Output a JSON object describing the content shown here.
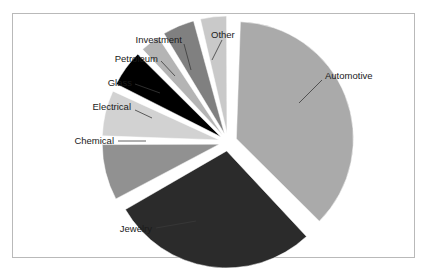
{
  "chart_data": {
    "type": "pie",
    "title": "",
    "categories": [
      "Automotive",
      "Jewelry",
      "Chemical",
      "Electrical",
      "Glass",
      "Petroleum",
      "Investment",
      "Other"
    ],
    "values": [
      37.5,
      29.2,
      8.3,
      6.9,
      5.6,
      3.3,
      5.0,
      4.2
    ],
    "unit": "percent",
    "exploded": true,
    "legend": "none",
    "labels_position": "outside-with-leader-lines",
    "colors": [
      "#aaaaaa",
      "#2b2b2b",
      "#919191",
      "#d2d2d2",
      "#000000",
      "#b4b4b4",
      "#808080",
      "#c9c9c9"
    ],
    "slices": [
      {
        "name": "Automotive",
        "value": 37.5,
        "color": "#aaaaaa",
        "start_angle": 3,
        "end_angle": 138
      },
      {
        "name": "Jewelry",
        "value": 29.2,
        "color": "#2b2b2b",
        "start_angle": 148,
        "end_angle": 253
      },
      {
        "name": "Chemical",
        "value": 8.3,
        "color": "#919191",
        "start_angle": 261,
        "end_angle": 291
      },
      {
        "name": "Electrical",
        "value": 6.9,
        "color": "#d2d2d2",
        "start_angle": 293,
        "end_angle": 318
      },
      {
        "name": "Glass",
        "value": 5.6,
        "color": "#000000",
        "start_angle": 320,
        "end_angle": 340
      },
      {
        "name": "Petroleum",
        "value": 3.3,
        "color": "#b4b4b4",
        "start_angle": 341,
        "end_angle": 353
      },
      {
        "name": "Investment",
        "value": 5.0,
        "color": "#808080",
        "start_angle": 354,
        "end_angle": 372
      },
      {
        "name": "Other",
        "value": 4.2,
        "color": "#c9c9c9",
        "start_angle": 374,
        "end_angle": 389
      }
    ]
  },
  "labels": {
    "automotive": "Automotive",
    "jewelry": "Jewelry",
    "chemical": "Chemical",
    "electrical": "Electrical",
    "glass": "Glass",
    "petroleum": "Petroleum",
    "investment": "Investment",
    "other": "Other"
  },
  "frame": {
    "border_color": "#b9b9b9",
    "background": "#ffffff"
  }
}
